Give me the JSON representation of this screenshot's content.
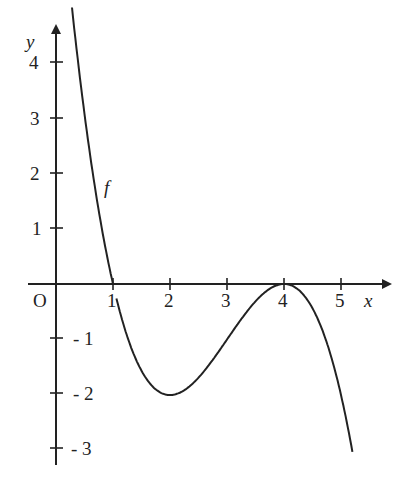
{
  "chart_data": {
    "type": "line",
    "title": "",
    "xlabel": "x",
    "ylabel": "y",
    "origin_label": "O",
    "curve_label": "f",
    "function": "f(x) = -(x-1)(x-4)^2 / 2",
    "xlim": [
      0,
      5.5
    ],
    "ylim": [
      -3,
      4.3
    ],
    "x_ticks": [
      1,
      2,
      3,
      4,
      5
    ],
    "x_tick_labels": [
      "1",
      "2",
      "3",
      "4",
      "5"
    ],
    "y_ticks": [
      4,
      3,
      2,
      1,
      -1,
      -2,
      -3
    ],
    "y_tick_labels": [
      "4",
      "3",
      "2",
      "1",
      "- 1",
      "- 2",
      "- 3"
    ],
    "grid": false,
    "key_points": [
      {
        "x": 1,
        "y": 0,
        "note": "root"
      },
      {
        "x": 2,
        "y": -2,
        "note": "local minimum"
      },
      {
        "x": 4,
        "y": 0,
        "note": "local maximum (double root)"
      }
    ],
    "series": [
      {
        "name": "f",
        "x": [
          0.3,
          0.5,
          1,
          1.5,
          2,
          2.5,
          3,
          3.5,
          4,
          4.5,
          5,
          5.2
        ],
        "values": [
          4.4,
          3.1,
          0,
          -1.56,
          -2,
          -1.69,
          -1,
          -0.31,
          0,
          -0.44,
          -2,
          -3
        ]
      }
    ]
  }
}
